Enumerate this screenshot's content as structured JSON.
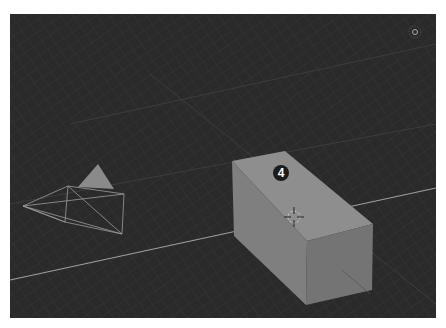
{
  "viewport": {
    "background": "#2a2a2a",
    "grid_color": "#3a3a3a",
    "axis_line_color": "#9a9a9a",
    "step_badge": {
      "label": "4"
    }
  },
  "objects": [
    {
      "name": "box",
      "type": "mesh",
      "color_top": "#8c8c8c",
      "color_front": "#7a7a7a",
      "color_side": "#6e6e6e"
    },
    {
      "name": "camera",
      "type": "camera-wireframe",
      "color": "#9a9a9a"
    },
    {
      "name": "3d-cursor",
      "type": "cursor"
    }
  ],
  "gizmo": {
    "icon": "view-gizmo-icon"
  }
}
